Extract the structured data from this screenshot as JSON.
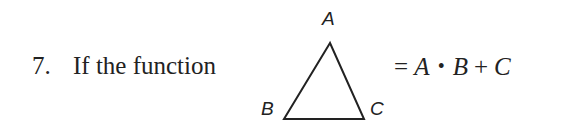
{
  "problem": {
    "number": "7.",
    "text": "If the function"
  },
  "diagram": {
    "shape": "triangle",
    "vertices": {
      "top": "A",
      "bottom_left": "B",
      "bottom_right": "C"
    }
  },
  "equation": {
    "equals": "=",
    "term1": "A",
    "multiply": "•",
    "term2": "B",
    "plus": "+",
    "term3": "C"
  }
}
